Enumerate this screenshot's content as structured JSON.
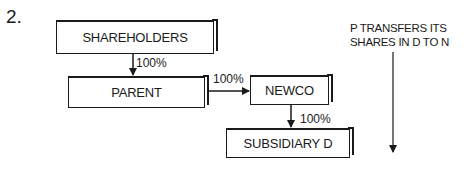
{
  "diagram": {
    "step_number": "2.",
    "nodes": {
      "shareholders": "SHAREHOLDERS",
      "parent": "PARENT",
      "newco": "NEWCO",
      "subsidiary_d": "SUBSIDIARY D"
    },
    "edges": {
      "shareholders_to_parent": "100%",
      "parent_to_newco": "100%",
      "newco_to_subsidiary_d": "100%"
    },
    "caption": {
      "line1": "P TRANSFERS ITS",
      "line2": "SHARES IN D TO N"
    },
    "colors": {
      "ink": "#1a1a1a",
      "background": "#ffffff"
    }
  }
}
